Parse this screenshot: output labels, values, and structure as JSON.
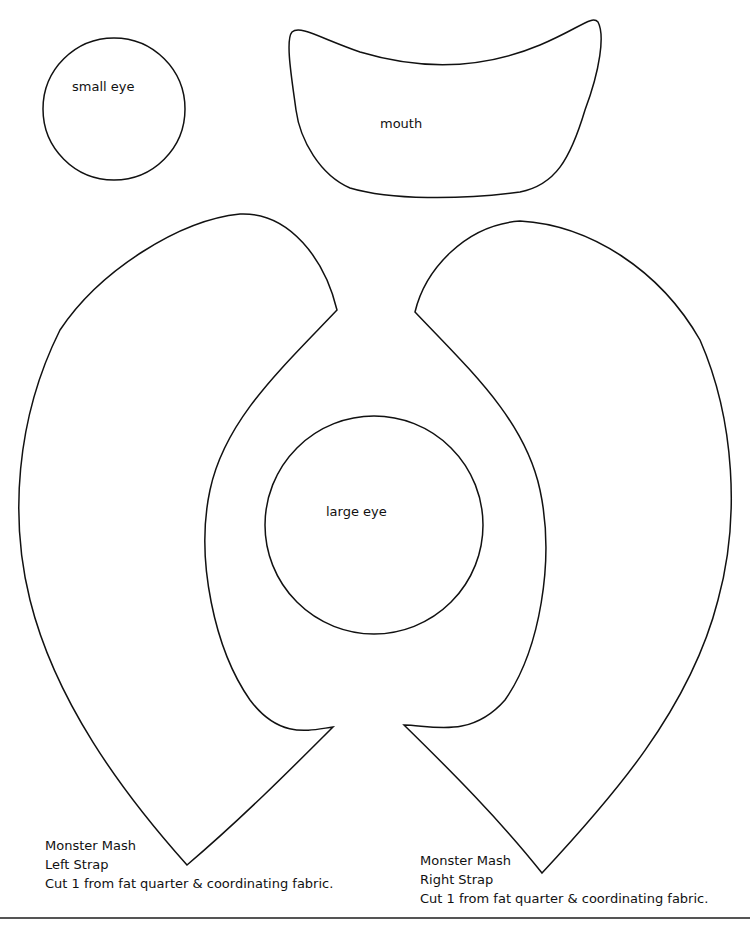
{
  "pieces": {
    "small_eye": {
      "label": "small eye"
    },
    "mouth": {
      "label": "mouth"
    },
    "large_eye": {
      "label": "large eye"
    },
    "left_strap": {
      "lines": [
        "Monster Mash",
        "Left Strap",
        "Cut 1 from fat quarter & coordinating fabric."
      ]
    },
    "right_strap": {
      "lines": [
        "Monster Mash",
        "Right Strap",
        "Cut 1 from fat quarter & coordinating fabric."
      ]
    }
  }
}
